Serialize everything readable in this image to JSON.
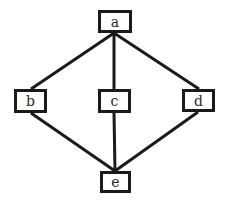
{
  "diagram": {
    "type": "hasse-diagram",
    "nodes": [
      {
        "id": "a",
        "label": "a",
        "x": 98,
        "y": 10,
        "w": 34,
        "h": 23
      },
      {
        "id": "b",
        "label": "b",
        "x": 14,
        "y": 89,
        "w": 33,
        "h": 24
      },
      {
        "id": "c",
        "label": "c",
        "x": 98,
        "y": 89,
        "w": 33,
        "h": 24
      },
      {
        "id": "d",
        "label": "d",
        "x": 182,
        "y": 89,
        "w": 33,
        "h": 23
      },
      {
        "id": "e",
        "label": "e",
        "x": 100,
        "y": 171,
        "w": 31,
        "h": 22
      }
    ],
    "edges": [
      {
        "from": "a",
        "to": "b",
        "x1": 114,
        "y1": 33,
        "x2": 31,
        "y2": 89
      },
      {
        "from": "a",
        "to": "c",
        "x1": 114,
        "y1": 33,
        "x2": 114,
        "y2": 89
      },
      {
        "from": "a",
        "to": "d",
        "x1": 114,
        "y1": 33,
        "x2": 199,
        "y2": 89
      },
      {
        "from": "b",
        "to": "e",
        "x1": 31,
        "y1": 113,
        "x2": 115,
        "y2": 171
      },
      {
        "from": "c",
        "to": "e",
        "x1": 114,
        "y1": 113,
        "x2": 115,
        "y2": 171
      },
      {
        "from": "d",
        "to": "e",
        "x1": 198,
        "y1": 112,
        "x2": 115,
        "y2": 171
      }
    ],
    "colors": {
      "stroke": "#1a1a1a",
      "background": "#ffffff",
      "text": "#2a2a2a"
    }
  }
}
